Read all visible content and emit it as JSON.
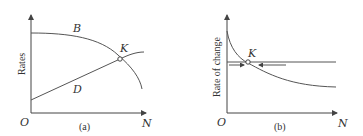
{
  "panel_a": {
    "caption": "(a)",
    "y_label": "Rates",
    "origin_label": "O",
    "x_label": "N",
    "curve_b_label": "B",
    "curve_d_label": "D",
    "point_label": "K"
  },
  "panel_b": {
    "caption": "(b)",
    "y_label": "Rate of change",
    "origin_label": "O",
    "x_label": "N",
    "point_label": "K"
  },
  "colors": {
    "line": "#555555",
    "text": "#333333",
    "background": "#ffffff"
  }
}
